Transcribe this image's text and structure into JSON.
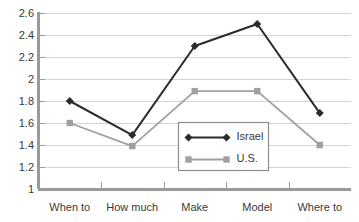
{
  "chart_data": {
    "type": "line",
    "title": "",
    "xlabel": "",
    "ylabel": "",
    "categories": [
      "When to",
      "How much",
      "Make",
      "Model",
      "Where to"
    ],
    "series": [
      {
        "name": "Israel",
        "values": [
          1.8,
          1.49,
          2.3,
          2.5,
          1.69
        ],
        "color": "#2b2b2b",
        "marker": "diamond"
      },
      {
        "name": "U.S.",
        "values": [
          1.6,
          1.39,
          1.89,
          1.89,
          1.4
        ],
        "color": "#a0a0a0",
        "marker": "square"
      }
    ],
    "ylim": [
      1,
      2.6
    ],
    "ytick_labels": [
      "2.6",
      "2.4",
      "2.2",
      "2",
      "1.8",
      "1.6",
      "1.4",
      "1.2",
      "1"
    ],
    "ytick_values": [
      2.6,
      2.4,
      2.2,
      2.0,
      1.8,
      1.6,
      1.4,
      1.2,
      1.0
    ],
    "grid": true,
    "legend_position": "center"
  },
  "legend": {
    "entries": [
      {
        "label": "Israel"
      },
      {
        "label": "U.S."
      }
    ]
  },
  "colors": {
    "israel": "#2b2b2b",
    "us": "#a0a0a0",
    "grid": "#d3d3d3",
    "axis": "#9a9a9a",
    "text": "#3a3a3a",
    "background": "#ffffff"
  }
}
